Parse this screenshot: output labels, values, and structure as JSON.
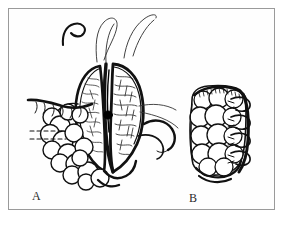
{
  "figure": {
    "type": "line-illustration",
    "description": "Two-panel black-and-white pen-and-ink surgical illustration on a white field enclosed by a thin grey rectangular border.",
    "background_color": "#ffffff",
    "ink_color": "#111111",
    "frame_color": "#9a9a9a",
    "frame": {
      "left": 8,
      "top": 8,
      "width": 267,
      "height": 202,
      "stroke_width": 1
    },
    "panels": [
      {
        "id": "A",
        "label": "A",
        "label_x": 32,
        "label_y": 190,
        "description": "Opened tubular viscus held apart showing two everted lobes with a dark central lumen; stippled and cross-hatched mucosal surface; lobulated tissue mass along the lower left; long thin suture threads rising from the top and two curved suture needles at the right; short dashed guide lines at the left margin.",
        "elements": [
          "suture-thread-left",
          "suture-thread-center",
          "suture-thread-right",
          "curved-needle-upper-right",
          "curved-needle-lower-right",
          "everted-lobe-left",
          "everted-lobe-right",
          "central-lumen-dot",
          "lobulated-tissue-mass",
          "dashed-guide-lines"
        ]
      },
      {
        "id": "B",
        "label": "B",
        "label_x": 189,
        "label_y": 192,
        "description": "Closed and sutured stump of the same structure, drawn as a rounded lobulated block with a row of interrupted sutures looping over the right-hand closed edge.",
        "elements": [
          "closed-stump-body",
          "lobulated-surface",
          "suture-row-right-edge",
          "serosal-edge-shading"
        ]
      }
    ]
  }
}
